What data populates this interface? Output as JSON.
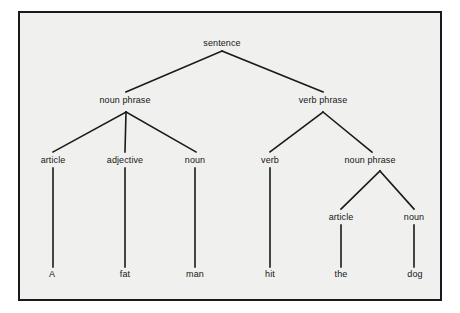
{
  "figure": {
    "kind": "syntax-tree-diagram",
    "sentence_text": "A fat man hit the dog",
    "background_color": "#f0f0ee",
    "frame_color": "#1a1a1a",
    "line_color": "#1a1a1a",
    "text_color": "#161616"
  },
  "nodes": {
    "root": {
      "label": "sentence",
      "x": 222,
      "y": 43
    },
    "np1": {
      "label": "noun phrase",
      "x": 125,
      "y": 100
    },
    "vp": {
      "label": "verb phrase",
      "x": 323,
      "y": 100
    },
    "article1": {
      "label": "article",
      "x": 53,
      "y": 160
    },
    "adjective": {
      "label": "adjective",
      "x": 125,
      "y": 160
    },
    "noun1": {
      "label": "noun",
      "x": 195,
      "y": 160
    },
    "verb": {
      "label": "verb",
      "x": 270,
      "y": 160
    },
    "np2": {
      "label": "noun phrase",
      "x": 370,
      "y": 160
    },
    "article2": {
      "label": "article",
      "x": 341,
      "y": 217
    },
    "noun2": {
      "label": "noun",
      "x": 414,
      "y": 217
    }
  },
  "leaves": [
    {
      "word": "A",
      "x": 52,
      "y": 274,
      "parent": "article1"
    },
    {
      "word": "fat",
      "x": 125,
      "y": 274,
      "parent": "adjective"
    },
    {
      "word": "man",
      "x": 195,
      "y": 274,
      "parent": "noun1"
    },
    {
      "word": "hit",
      "x": 270,
      "y": 274,
      "parent": "verb"
    },
    {
      "word": "the",
      "x": 341,
      "y": 274,
      "parent": "article2"
    },
    {
      "word": "dog",
      "x": 415,
      "y": 274,
      "parent": "noun2"
    }
  ],
  "edges": [
    {
      "from": "sentence",
      "to": "noun phrase",
      "x1": 222,
      "y1": 51,
      "x2": 126,
      "y2": 92
    },
    {
      "from": "sentence",
      "to": "verb phrase",
      "x1": 222,
      "y1": 51,
      "x2": 323,
      "y2": 92
    },
    {
      "from": "noun phrase",
      "to": "article",
      "x1": 126,
      "y1": 112,
      "x2": 53,
      "y2": 152
    },
    {
      "from": "noun phrase",
      "to": "adjective",
      "x1": 126,
      "y1": 112,
      "x2": 125,
      "y2": 152
    },
    {
      "from": "noun phrase",
      "to": "noun",
      "x1": 126,
      "y1": 112,
      "x2": 196,
      "y2": 152
    },
    {
      "from": "verb phrase",
      "to": "verb",
      "x1": 323,
      "y1": 112,
      "x2": 270,
      "y2": 152
    },
    {
      "from": "verb phrase",
      "to": "noun phrase",
      "x1": 323,
      "y1": 112,
      "x2": 372,
      "y2": 152
    },
    {
      "from": "noun phrase 2",
      "to": "article",
      "x1": 380,
      "y1": 171,
      "x2": 341,
      "y2": 209
    },
    {
      "from": "noun phrase 2",
      "to": "noun",
      "x1": 380,
      "y1": 171,
      "x2": 414,
      "y2": 209
    },
    {
      "from": "article",
      "to": "A",
      "x1": 53,
      "y1": 168,
      "x2": 53,
      "y2": 267
    },
    {
      "from": "adjective",
      "to": "fat",
      "x1": 125,
      "y1": 168,
      "x2": 125,
      "y2": 267
    },
    {
      "from": "noun",
      "to": "man",
      "x1": 195,
      "y1": 168,
      "x2": 195,
      "y2": 267
    },
    {
      "from": "verb",
      "to": "hit",
      "x1": 270,
      "y1": 168,
      "x2": 270,
      "y2": 267
    },
    {
      "from": "article 2",
      "to": "the",
      "x1": 341,
      "y1": 225,
      "x2": 341,
      "y2": 267
    },
    {
      "from": "noun 2",
      "to": "dog",
      "x1": 414,
      "y1": 225,
      "x2": 414,
      "y2": 267
    }
  ]
}
